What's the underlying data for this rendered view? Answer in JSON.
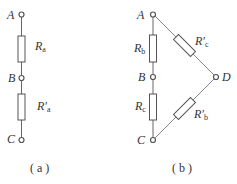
{
  "figure_a": {
    "caption": "( a )",
    "nodes": {
      "A": "A",
      "B": "B",
      "C": "C"
    },
    "resistors": [
      {
        "id": "Ra",
        "main": "R",
        "prime": "",
        "sub": "a"
      },
      {
        "id": "R'a",
        "main": "R",
        "prime": "′",
        "sub": "a"
      }
    ]
  },
  "figure_b": {
    "caption": "( b )",
    "nodes": {
      "A": "A",
      "B": "B",
      "C": "C",
      "D": "D"
    },
    "resistors": [
      {
        "id": "Rb",
        "main": "R",
        "prime": "",
        "sub": "b"
      },
      {
        "id": "Rc",
        "main": "R",
        "prime": "",
        "sub": "c"
      },
      {
        "id": "R'c",
        "main": "R",
        "prime": "′",
        "sub": "c"
      },
      {
        "id": "R'b",
        "main": "R",
        "prime": "′",
        "sub": "b"
      }
    ]
  },
  "colors": {
    "line": "#555555",
    "text": "#333333",
    "background": "#ffffff"
  }
}
